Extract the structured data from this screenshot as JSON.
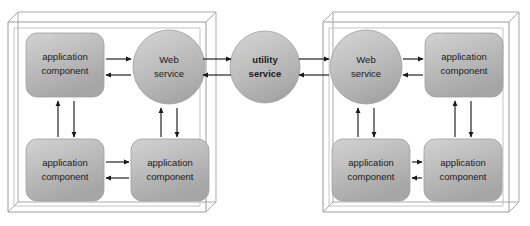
{
  "diagram": {
    "type": "architecture-diagram",
    "colors": {
      "node_fill_light": "#c9c9c9",
      "node_fill_dark": "#a8a8a8",
      "node_stroke": "#8e8e8e",
      "container_stroke": "#9a9a9a",
      "arrow_color": "#1a1a1a",
      "text_color": "#1a1a1a",
      "background": "#ffffff"
    },
    "containers": [
      {
        "id": "left-container",
        "name": "left-application-container",
        "nodes": [
          {
            "id": "l-app-tl",
            "name": "application-component-left-top",
            "shape": "rounded-rect",
            "line1": "application",
            "line2": "component"
          },
          {
            "id": "l-web",
            "name": "web-service-left",
            "shape": "circle",
            "line1": "Web",
            "line2": "service"
          },
          {
            "id": "l-app-bl",
            "name": "application-component-left-bottom-left",
            "shape": "rounded-rect",
            "line1": "application",
            "line2": "component"
          },
          {
            "id": "l-app-br",
            "name": "application-component-left-bottom-right",
            "shape": "rounded-rect",
            "line1": "application",
            "line2": "component"
          }
        ]
      },
      {
        "id": "right-container",
        "name": "right-application-container",
        "nodes": [
          {
            "id": "r-web",
            "name": "web-service-right",
            "shape": "circle",
            "line1": "Web",
            "line2": "service"
          },
          {
            "id": "r-app-tr",
            "name": "application-component-right-top",
            "shape": "rounded-rect",
            "line1": "application",
            "line2": "component"
          },
          {
            "id": "r-app-bl",
            "name": "application-component-right-bottom-left",
            "shape": "rounded-rect",
            "line1": "application",
            "line2": "component"
          },
          {
            "id": "r-app-br",
            "name": "application-component-right-bottom-right",
            "shape": "rounded-rect",
            "line1": "application",
            "line2": "component"
          }
        ]
      }
    ],
    "center_node": {
      "id": "utility",
      "name": "utility-service",
      "shape": "circle",
      "bold": true,
      "line1": "utility",
      "line2": "service"
    },
    "connections": [
      {
        "name": "left-app-top-to-web-service",
        "from": "l-app-tl",
        "to": "l-web",
        "direction": "right"
      },
      {
        "name": "left-web-service-to-app-top",
        "from": "l-web",
        "to": "l-app-tl",
        "direction": "left"
      },
      {
        "name": "left-app-bottom-left-to-web-service",
        "from": "l-app-bl",
        "to": "l-web",
        "direction": "up"
      },
      {
        "name": "left-web-service-to-app-bottom-left",
        "from": "l-web",
        "to": "l-app-bl",
        "direction": "down"
      },
      {
        "name": "left-app-bottom-left-to-bottom-right",
        "from": "l-app-bl",
        "to": "l-app-br",
        "direction": "right"
      },
      {
        "name": "left-app-bottom-right-to-bottom-left",
        "from": "l-app-br",
        "to": "l-app-bl",
        "direction": "left"
      },
      {
        "name": "left-app-bottom-right-to-web-service",
        "from": "l-app-br",
        "to": "l-web",
        "direction": "up"
      },
      {
        "name": "left-web-service-to-app-bottom-right",
        "from": "l-web",
        "to": "l-app-br",
        "direction": "down"
      },
      {
        "name": "left-web-service-to-utility-service",
        "from": "l-web",
        "to": "utility",
        "direction": "right"
      },
      {
        "name": "utility-service-to-left-web-service",
        "from": "utility",
        "to": "l-web",
        "direction": "left"
      },
      {
        "name": "utility-service-to-right-web-service",
        "from": "utility",
        "to": "r-web",
        "direction": "right"
      },
      {
        "name": "right-web-service-to-utility-service",
        "from": "r-web",
        "to": "utility",
        "direction": "left"
      },
      {
        "name": "right-web-service-to-app-top",
        "from": "r-web",
        "to": "r-app-tr",
        "direction": "right"
      },
      {
        "name": "right-app-top-to-web-service",
        "from": "r-app-tr",
        "to": "r-web",
        "direction": "left"
      },
      {
        "name": "right-app-bottom-left-to-web-service",
        "from": "r-app-bl",
        "to": "r-web",
        "direction": "up"
      },
      {
        "name": "right-web-service-to-app-bottom-left",
        "from": "r-web",
        "to": "r-app-bl",
        "direction": "down"
      },
      {
        "name": "right-app-bottom-left-to-bottom-right",
        "from": "r-app-bl",
        "to": "r-app-br",
        "direction": "right"
      },
      {
        "name": "right-app-bottom-right-to-bottom-left",
        "from": "r-app-br",
        "to": "r-app-bl",
        "direction": "left"
      },
      {
        "name": "right-app-bottom-right-to-web-service",
        "from": "r-app-br",
        "to": "r-web",
        "direction": "up"
      },
      {
        "name": "right-web-service-to-app-bottom-right",
        "from": "r-web",
        "to": "r-app-br",
        "direction": "down"
      }
    ]
  }
}
